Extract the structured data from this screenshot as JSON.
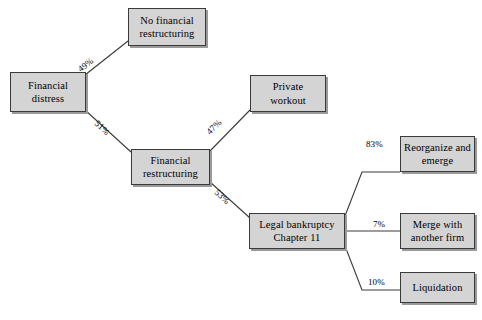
{
  "diagram": {
    "type": "decision-tree",
    "nodes": [
      {
        "id": "financial-distress",
        "label": "Financial\ndistress"
      },
      {
        "id": "no-financial-restructuring",
        "label": "No financial\nrestructuring"
      },
      {
        "id": "financial-restructuring",
        "label": "Financial\nrestructuring"
      },
      {
        "id": "private-workout",
        "label": "Private\nworkout"
      },
      {
        "id": "legal-bankruptcy",
        "label": "Legal bankruptcy\nChapter 11"
      },
      {
        "id": "reorganize-and-emerge",
        "label": "Reorganize and\nemerge"
      },
      {
        "id": "merge-with-another-firm",
        "label": "Merge with\nanother firm"
      },
      {
        "id": "liquidation",
        "label": "Liquidation"
      }
    ],
    "edges": [
      {
        "id": "edge-49",
        "from": "financial-distress",
        "to": "no-financial-restructuring",
        "label": "49%"
      },
      {
        "id": "edge-51",
        "from": "financial-distress",
        "to": "financial-restructuring",
        "label": "51%"
      },
      {
        "id": "edge-47",
        "from": "financial-restructuring",
        "to": "private-workout",
        "label": "47%"
      },
      {
        "id": "edge-53",
        "from": "financial-restructuring",
        "to": "legal-bankruptcy",
        "label": "53%"
      },
      {
        "id": "edge-83",
        "from": "legal-bankruptcy",
        "to": "reorganize-and-emerge",
        "label": "83%"
      },
      {
        "id": "edge-7",
        "from": "legal-bankruptcy",
        "to": "merge-with-another-firm",
        "label": "7%"
      },
      {
        "id": "edge-10",
        "from": "legal-bankruptcy",
        "to": "liquidation",
        "label": "10%"
      }
    ],
    "colors": {
      "node_fill": "#d4d4d4",
      "node_border": "#3a3a3a",
      "node_shadow": "#9a9a9a",
      "edge_stroke": "#3a3a3a",
      "text": "#000000",
      "background": "#ffffff"
    }
  }
}
